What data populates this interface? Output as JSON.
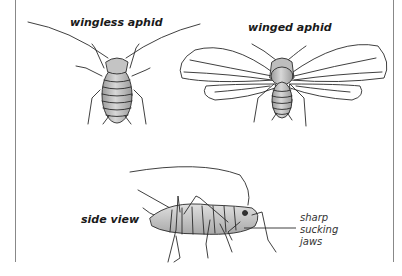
{
  "diagram": {
    "labels": {
      "wingless": "wingless aphid",
      "winged": "winged aphid",
      "side": "side view"
    },
    "callout": {
      "line1": "sharp",
      "line2": "sucking",
      "line3": "jaws"
    },
    "colors": {
      "outline": "#2a2a2a",
      "body_fill": "#c8c8c8",
      "body_shade": "#a9a9a9",
      "frame": "#888888",
      "wing_fill": "#ffffff"
    }
  }
}
